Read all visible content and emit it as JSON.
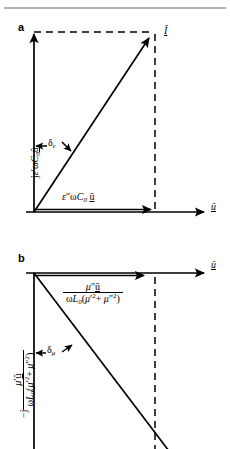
{
  "figure": {
    "type": "phasor-diagram-pair",
    "panels": [
      {
        "id": "a",
        "letter": "a",
        "vertical_axis_label": "jε′ωC₀û",
        "horizontal_component_label": "ε″ωC₀ û",
        "angle_label": "δε",
        "resultant_label": "Î",
        "reference_axis_label": "û"
      },
      {
        "id": "b",
        "letter": "b",
        "reference_axis_label": "û",
        "horizontal_component_numerator": "μ″û",
        "horizontal_component_denominator": "ωL₀(μ′² + μ″²)",
        "vertical_axis_prefix": "−j",
        "vertical_axis_numerator": "μ′û",
        "vertical_axis_denominator": "ωL₀(μ′² + μ″²)",
        "angle_label": "δμ"
      }
    ],
    "colors": {
      "ink": "#000000",
      "rule": "#9a9a9a",
      "background": "#ffffff"
    },
    "geometry": {
      "panel_a": {
        "origin": [
          34,
          212
        ],
        "vertical_axis_tip": [
          34,
          32
        ],
        "horizontal_component_tip": [
          155,
          212
        ],
        "resultant_tip": [
          152,
          36
        ],
        "dashed_top": [
          [
            34,
            32
          ],
          [
            152,
            32
          ]
        ],
        "dashed_right": [
          [
            155,
            36
          ],
          [
            155,
            212
          ]
        ],
        "baseline_axis_tip": [
          208,
          212
        ]
      },
      "panel_b": {
        "origin": [
          34,
          273
        ],
        "horizontal_component_tip": [
          148,
          273
        ],
        "baseline_axis_tip": [
          208,
          273
        ],
        "vertical_axis_tip": [
          34,
          449
        ],
        "resultant_tip": [
          168,
          449
        ],
        "dashed_right": [
          [
            155,
            277
          ],
          [
            155,
            449
          ]
        ]
      }
    }
  }
}
